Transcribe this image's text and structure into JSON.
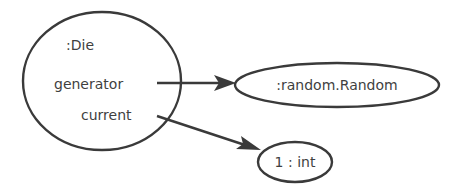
{
  "diagram": {
    "type": "object-reference-diagram",
    "nodes": {
      "die": {
        "label": ":Die",
        "fields": {
          "generator": "generator",
          "current": "current"
        }
      },
      "random": {
        "label": ":random.Random"
      },
      "int_value": {
        "label": "1 : int"
      }
    },
    "edges": [
      {
        "from": "die.generator",
        "to": "random",
        "label": "generator"
      },
      {
        "from": "die.current",
        "to": "int_value",
        "label": "current"
      }
    ],
    "colors": {
      "stroke": "#3a3a3a",
      "text": "#3f3f3f",
      "background": "#ffffff"
    }
  }
}
